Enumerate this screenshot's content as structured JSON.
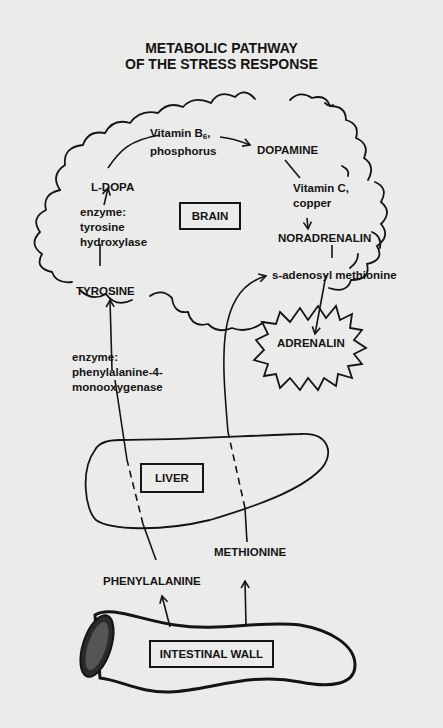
{
  "title": {
    "line1": "METABOLIC PATHWAY",
    "line2": "OF THE STRESS RESPONSE"
  },
  "organs": {
    "brain": "BRAIN",
    "liver": "LIVER",
    "intestine": "INTESTINAL WALL"
  },
  "compounds": {
    "phenylalanine": "PHENYLALANINE",
    "tyrosine": "TYROSINE",
    "ldopa": "L-DOPA",
    "dopamine": "DOPAMINE",
    "noradrenalin": "NORADRENALIN",
    "adrenalin": "ADRENALIN",
    "methionine": "METHIONINE",
    "sam": "s-adenosyl methionine"
  },
  "cofactors": {
    "phe_to_tyr": [
      "enzyme:",
      "phenylalanine-4-",
      "monooxygenase"
    ],
    "tyr_to_ldopa": [
      "enzyme:",
      "tyrosine",
      "hydroxylase"
    ],
    "ldopa_to_dopamine": {
      "line1_prefix": "Vitamin B",
      "line1_sub": "6",
      "line1_suffix": ",",
      "line2": "phosphorus"
    },
    "dopamine_to_noradrenalin": [
      "Vitamin C,",
      "copper"
    ]
  },
  "colors": {
    "background": "#ebebea",
    "ink": "#141414"
  }
}
